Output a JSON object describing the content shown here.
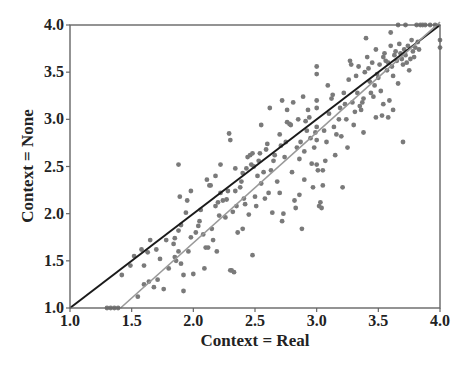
{
  "chart_data": {
    "type": "scatter",
    "title": "",
    "xlabel": "Context = Real",
    "ylabel": "Context = None",
    "xlim": [
      1.0,
      4.0
    ],
    "ylim": [
      1.0,
      4.0
    ],
    "xticks": [
      "1.0",
      "1.5",
      "2.0",
      "2.5",
      "3.0",
      "3.5",
      "4.0"
    ],
    "yticks": [
      "1.0",
      "1.5",
      "2.0",
      "2.5",
      "3.0",
      "3.5",
      "4.0"
    ],
    "grid": false,
    "legend": null,
    "lines": [
      {
        "name": "identity",
        "color": "#1a1a1a",
        "x": [
          1.0,
          4.0
        ],
        "y": [
          1.0,
          4.0
        ]
      },
      {
        "name": "regression",
        "color": "#999999",
        "x": [
          1.41,
          4.0
        ],
        "y": [
          1.0,
          4.05
        ]
      }
    ],
    "point_color": "#7a7a7a",
    "series": [
      {
        "name": "items",
        "points": [
          [
            1.3,
            1.0
          ],
          [
            1.33,
            1.0
          ],
          [
            1.36,
            1.0
          ],
          [
            1.39,
            1.0
          ],
          [
            1.42,
            1.35
          ],
          [
            1.49,
            1.45
          ],
          [
            1.52,
            1.55
          ],
          [
            1.58,
            1.62
          ],
          [
            1.63,
            1.59
          ],
          [
            1.6,
            1.25
          ],
          [
            1.64,
            1.28
          ],
          [
            1.68,
            1.22
          ],
          [
            1.71,
            1.3
          ],
          [
            1.73,
            1.52
          ],
          [
            1.76,
            1.2
          ],
          [
            1.8,
            1.42
          ],
          [
            1.84,
            1.68
          ],
          [
            1.85,
            1.74
          ],
          [
            1.88,
            1.82
          ],
          [
            1.88,
            2.52
          ],
          [
            1.89,
            2.18
          ],
          [
            1.9,
            1.88
          ],
          [
            1.92,
            1.35
          ],
          [
            1.92,
            1.18
          ],
          [
            1.55,
            1.12
          ],
          [
            1.6,
            1.45
          ],
          [
            1.65,
            1.72
          ],
          [
            1.7,
            1.62
          ],
          [
            1.78,
            1.72
          ],
          [
            1.85,
            1.54
          ],
          [
            1.86,
            1.5
          ],
          [
            1.88,
            1.6
          ],
          [
            1.9,
            1.47
          ],
          [
            1.94,
            2.01
          ],
          [
            1.96,
            1.6
          ],
          [
            1.98,
            1.75
          ],
          [
            2.0,
            1.36
          ],
          [
            2.02,
            1.8
          ],
          [
            2.04,
            1.87
          ],
          [
            2.05,
            1.92
          ],
          [
            2.06,
            2.04
          ],
          [
            2.08,
            1.78
          ],
          [
            2.09,
            1.42
          ],
          [
            2.1,
            1.64
          ],
          [
            2.11,
            2.36
          ],
          [
            2.12,
            1.64
          ],
          [
            2.13,
            2.3
          ],
          [
            2.14,
            2.3
          ],
          [
            2.15,
            1.84
          ],
          [
            2.16,
            1.72
          ],
          [
            2.18,
            2.08
          ],
          [
            2.19,
            1.6
          ],
          [
            2.2,
            2.12
          ],
          [
            2.21,
            1.98
          ],
          [
            2.22,
            2.22
          ],
          [
            2.24,
            2.14
          ],
          [
            2.26,
            1.96
          ],
          [
            2.27,
            2.15
          ],
          [
            2.28,
            2.24
          ],
          [
            2.29,
            2.85
          ],
          [
            2.3,
            2.78
          ],
          [
            2.3,
            1.4
          ],
          [
            2.31,
            1.4
          ],
          [
            2.32,
            2.02
          ],
          [
            2.33,
            1.38
          ],
          [
            2.34,
            2.24
          ],
          [
            2.35,
            2.08
          ],
          [
            2.36,
            1.8
          ],
          [
            2.38,
            2.28
          ],
          [
            2.39,
            2.34
          ],
          [
            2.4,
            2.43
          ],
          [
            2.41,
            2.16
          ],
          [
            2.42,
            2.1
          ],
          [
            2.43,
            2.48
          ],
          [
            2.44,
            2.6
          ],
          [
            2.45,
            1.99
          ],
          [
            2.46,
            2.62
          ],
          [
            2.47,
            2.52
          ],
          [
            2.48,
            1.56
          ],
          [
            2.49,
            2.5
          ],
          [
            2.5,
            2.18
          ],
          [
            2.51,
            2.08
          ],
          [
            2.52,
            2.4
          ],
          [
            2.53,
            2.56
          ],
          [
            2.54,
            2.64
          ],
          [
            2.55,
            2.32
          ],
          [
            2.57,
            2.44
          ],
          [
            2.58,
            2.16
          ],
          [
            2.59,
            2.68
          ],
          [
            2.6,
            2.74
          ],
          [
            2.61,
            2.22
          ],
          [
            2.62,
            3.12
          ],
          [
            2.63,
            2.46
          ],
          [
            2.64,
            2.01
          ],
          [
            2.65,
            2.56
          ],
          [
            2.66,
            2.62
          ],
          [
            2.68,
            2.34
          ],
          [
            2.7,
            2.84
          ],
          [
            2.71,
            2.72
          ],
          [
            2.72,
            1.92
          ],
          [
            2.73,
            2.0
          ],
          [
            2.74,
            2.6
          ],
          [
            2.75,
            2.76
          ],
          [
            2.76,
            2.97
          ],
          [
            2.78,
            2.95
          ],
          [
            2.79,
            2.94
          ],
          [
            2.8,
            2.44
          ],
          [
            2.81,
            3.18
          ],
          [
            2.82,
            2.14
          ],
          [
            2.83,
            2.06
          ],
          [
            2.84,
            2.7
          ],
          [
            2.85,
            3.0
          ],
          [
            2.86,
            2.58
          ],
          [
            2.87,
            2.76
          ],
          [
            2.88,
            1.84
          ],
          [
            2.89,
            3.24
          ],
          [
            2.9,
            2.66
          ],
          [
            2.9,
            2.36
          ],
          [
            2.91,
            2.98
          ],
          [
            2.92,
            2.88
          ],
          [
            2.93,
            3.1
          ],
          [
            2.94,
            3.02
          ],
          [
            2.95,
            2.8
          ],
          [
            2.96,
            2.53
          ],
          [
            2.97,
            2.28
          ],
          [
            2.98,
            2.7
          ],
          [
            2.99,
            2.86
          ],
          [
            3.0,
            3.56
          ],
          [
            3.0,
            3.48
          ],
          [
            3.0,
            3.2
          ],
          [
            3.0,
            3.12
          ],
          [
            3.0,
            2.92
          ],
          [
            3.0,
            2.78
          ],
          [
            3.0,
            2.52
          ],
          [
            3.01,
            2.46
          ],
          [
            3.02,
            2.08
          ],
          [
            3.03,
            2.12
          ],
          [
            3.04,
            2.06
          ],
          [
            3.05,
            2.46
          ],
          [
            3.06,
            2.88
          ],
          [
            3.07,
            2.56
          ],
          [
            3.08,
            2.76
          ],
          [
            3.09,
            3.36
          ],
          [
            3.1,
            3.06
          ],
          [
            3.12,
            3.22
          ],
          [
            3.13,
            3.26
          ],
          [
            3.14,
            2.92
          ],
          [
            3.15,
            2.62
          ],
          [
            3.16,
            2.84
          ],
          [
            3.18,
            3.0
          ],
          [
            3.19,
            3.12
          ],
          [
            3.2,
            2.82
          ],
          [
            3.21,
            2.28
          ],
          [
            3.22,
            3.28
          ],
          [
            3.23,
            3.16
          ],
          [
            3.24,
            3.0
          ],
          [
            3.25,
            2.7
          ],
          [
            3.26,
            3.42
          ],
          [
            3.27,
            3.62
          ],
          [
            3.28,
            3.58
          ],
          [
            3.29,
            3.18
          ],
          [
            3.3,
            2.94
          ],
          [
            3.31,
            3.08
          ],
          [
            3.32,
            3.46
          ],
          [
            3.33,
            3.28
          ],
          [
            3.34,
            3.56
          ],
          [
            3.35,
            3.14
          ],
          [
            3.36,
            3.1
          ],
          [
            3.37,
            3.18
          ],
          [
            3.38,
            3.22
          ],
          [
            3.39,
            3.5
          ],
          [
            3.4,
            3.86
          ],
          [
            3.41,
            3.66
          ],
          [
            3.42,
            3.54
          ],
          [
            3.43,
            3.4
          ],
          [
            3.44,
            3.28
          ],
          [
            3.45,
            3.6
          ],
          [
            3.46,
            3.24
          ],
          [
            3.47,
            3.36
          ],
          [
            3.48,
            3.74
          ],
          [
            3.49,
            3.48
          ],
          [
            3.5,
            3.44
          ],
          [
            3.51,
            3.58
          ],
          [
            3.52,
            3.3
          ],
          [
            3.53,
            3.04
          ],
          [
            3.54,
            3.66
          ],
          [
            3.55,
            3.7
          ],
          [
            3.56,
            3.62
          ],
          [
            3.57,
            3.52
          ],
          [
            3.58,
            3.6
          ],
          [
            3.59,
            3.2
          ],
          [
            3.6,
            3.78
          ],
          [
            3.61,
            3.56
          ],
          [
            3.62,
            3.46
          ],
          [
            3.63,
            3.68
          ],
          [
            3.64,
            3.72
          ],
          [
            3.65,
            3.62
          ],
          [
            3.66,
            3.38
          ],
          [
            3.67,
            3.8
          ],
          [
            3.68,
            3.7
          ],
          [
            3.69,
            3.64
          ],
          [
            3.7,
            3.58
          ],
          [
            3.7,
            2.76
          ],
          [
            3.71,
            3.74
          ],
          [
            3.72,
            3.68
          ],
          [
            3.73,
            3.6
          ],
          [
            3.74,
            3.78
          ],
          [
            3.75,
            3.52
          ],
          [
            3.76,
            3.64
          ],
          [
            3.77,
            3.84
          ],
          [
            3.78,
            3.72
          ],
          [
            3.79,
            3.66
          ],
          [
            3.8,
            3.76
          ],
          [
            3.81,
            4.0
          ],
          [
            3.82,
            3.82
          ],
          [
            3.83,
            3.74
          ],
          [
            3.84,
            4.0
          ],
          [
            3.86,
            4.0
          ],
          [
            3.88,
            4.0
          ],
          [
            3.92,
            4.0
          ],
          [
            3.96,
            4.0
          ],
          [
            4.0,
            3.84
          ],
          [
            4.0,
            3.76
          ],
          [
            3.72,
            4.0
          ],
          [
            3.66,
            4.0
          ],
          [
            3.6,
            3.92
          ],
          [
            2.72,
            3.2
          ],
          [
            2.76,
            3.1
          ],
          [
            2.55,
            2.94
          ],
          [
            2.48,
            2.64
          ],
          [
            2.34,
            2.48
          ],
          [
            2.22,
            2.52
          ],
          [
            2.18,
            2.4
          ],
          [
            1.98,
            2.24
          ],
          [
            1.95,
            2.14
          ],
          [
            2.4,
            1.84
          ],
          [
            2.7,
            2.22
          ],
          [
            2.86,
            2.2
          ],
          [
            3.05,
            2.3
          ],
          [
            3.38,
            2.86
          ],
          [
            3.48,
            3.02
          ],
          [
            3.58,
            3.02
          ],
          [
            3.62,
            3.1
          ],
          [
            3.54,
            3.16
          ]
        ]
      }
    ]
  }
}
